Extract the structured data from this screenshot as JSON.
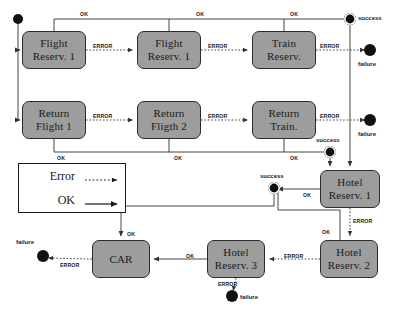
{
  "diagram": {
    "type": "uml-state-diagram",
    "colors": {
      "state_fill": "#9d9d9d",
      "state_border": "#2b2b2b",
      "line": "#444444",
      "node": "#111111",
      "background": "#ffffff"
    },
    "states": [
      {
        "id": "flight-reserv-1",
        "lines": [
          "Flight",
          "Reserv. 1"
        ],
        "x": 22,
        "y": 31,
        "w": 64,
        "h": 38
      },
      {
        "id": "flight-reserv-2",
        "lines": [
          "Flight",
          "Reserv. 1"
        ],
        "x": 137,
        "y": 31,
        "w": 64,
        "h": 38
      },
      {
        "id": "train-reserv",
        "lines": [
          "Train",
          "Reserv."
        ],
        "x": 252,
        "y": 31,
        "w": 64,
        "h": 38
      },
      {
        "id": "return-flight-1",
        "lines": [
          "Return",
          "Flight 1"
        ],
        "x": 22,
        "y": 101,
        "w": 64,
        "h": 38
      },
      {
        "id": "return-flight-2",
        "lines": [
          "Return",
          "Fligth 2"
        ],
        "x": 137,
        "y": 101,
        "w": 64,
        "h": 38
      },
      {
        "id": "return-train",
        "lines": [
          "Return",
          "Train."
        ],
        "x": 252,
        "y": 101,
        "w": 64,
        "h": 38
      },
      {
        "id": "hotel-reserv-1",
        "lines": [
          "Hotel",
          "Reserv. 1"
        ],
        "x": 320,
        "y": 170,
        "w": 60,
        "h": 38
      },
      {
        "id": "car",
        "lines": [
          "CAR"
        ],
        "x": 92,
        "y": 240,
        "w": 58,
        "h": 38
      },
      {
        "id": "hotel-reserv-3",
        "lines": [
          "Hotel",
          "Reserv. 3"
        ],
        "x": 207,
        "y": 240,
        "w": 58,
        "h": 38
      },
      {
        "id": "hotel-reserv-2",
        "lines": [
          "Hotel",
          "Reserv. 2"
        ],
        "x": 320,
        "y": 240,
        "w": 58,
        "h": 38
      }
    ],
    "nodes": [
      {
        "id": "start",
        "kind": "initial",
        "label": "",
        "cx": 18,
        "cy": 19
      },
      {
        "id": "success-top",
        "kind": "final",
        "label": "success",
        "cx": 350,
        "cy": 19,
        "label_x": 358,
        "label_y": 15
      },
      {
        "id": "failure-top",
        "kind": "final",
        "label": "failure",
        "cx": 370,
        "cy": 50,
        "label_x": 360,
        "label_y": 63
      },
      {
        "id": "failure-mid",
        "kind": "final",
        "label": "failure",
        "cx": 370,
        "cy": 120,
        "label_x": 360,
        "label_y": 133
      },
      {
        "id": "success-mid",
        "kind": "final",
        "label": "success",
        "cx": 330,
        "cy": 152,
        "label_x": 318,
        "label_y": 140
      },
      {
        "id": "success-lower",
        "kind": "final",
        "label": "success",
        "cx": 274,
        "cy": 188,
        "label_x": 262,
        "label_y": 176
      },
      {
        "id": "failure-left",
        "kind": "final",
        "label": "failure",
        "cx": 43,
        "cy": 256,
        "label_x": 16,
        "label_y": 241
      },
      {
        "id": "failure-bottom",
        "kind": "final",
        "label": "failure",
        "cx": 232,
        "cy": 296,
        "label_x": 240,
        "label_y": 292
      }
    ],
    "edge_labels": [
      {
        "text": "OK",
        "x": 80,
        "y": 11
      },
      {
        "text": "OK",
        "x": 196,
        "y": 11
      },
      {
        "text": "OK",
        "x": 290,
        "y": 11
      },
      {
        "text": "ERROR",
        "x": 93,
        "y": 43
      },
      {
        "text": "ERROR",
        "x": 208,
        "y": 43
      },
      {
        "text": "ERROR",
        "x": 320,
        "y": 43
      },
      {
        "text": "ERROR",
        "x": 93,
        "y": 113
      },
      {
        "text": "ERROR",
        "x": 208,
        "y": 113
      },
      {
        "text": "ERROR",
        "x": 320,
        "y": 113
      },
      {
        "text": "OK",
        "x": 57,
        "y": 155
      },
      {
        "text": "OK",
        "x": 174,
        "y": 155
      },
      {
        "text": "OK",
        "x": 290,
        "y": 155
      },
      {
        "text": "OK",
        "x": 303,
        "y": 192
      },
      {
        "text": "ERROR",
        "x": 349,
        "y": 219
      },
      {
        "text": "OK",
        "x": 127,
        "y": 231
      },
      {
        "text": "OK",
        "x": 318,
        "y": 231
      },
      {
        "text": "OK",
        "x": 188,
        "y": 253
      },
      {
        "text": "ERROR",
        "x": 283,
        "y": 253
      },
      {
        "text": "ERROR",
        "x": 60,
        "y": 262
      },
      {
        "text": "ERROR",
        "x": 218,
        "y": 282
      }
    ],
    "legend": {
      "x": 18,
      "y": 163,
      "w": 108,
      "h": 50,
      "rows": [
        {
          "label": "Error",
          "style": "dotted"
        },
        {
          "label": "OK",
          "style": "solid"
        }
      ]
    }
  }
}
